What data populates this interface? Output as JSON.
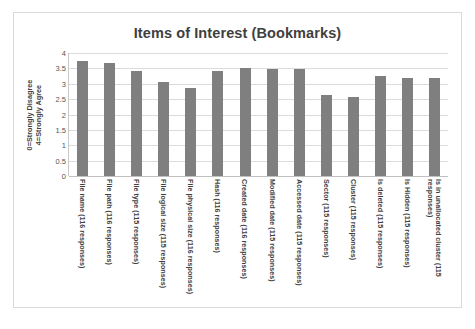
{
  "chart_data": {
    "type": "bar",
    "title": "Items of Interest (Bookmarks)",
    "xlabel": "",
    "ylabel": "0=Strongly Disagree 4=Strongly Agree",
    "ylabel_lines": [
      "0=Strongly Disagree",
      "4=Strongly Agree"
    ],
    "ylim": [
      0,
      4
    ],
    "ytick_labels": [
      "4",
      "3.5",
      "3",
      "2.5",
      "2",
      "1.5",
      "1",
      "0.5",
      "0"
    ],
    "ytick_values": [
      4,
      3.5,
      3,
      2.5,
      2,
      1.5,
      1,
      0.5,
      0
    ],
    "grid": true,
    "legend": "none",
    "bar_color": "#7f7f7f",
    "categories": [
      "File name (116 responses)",
      "File path (116 responses)",
      "File type (115 responses)",
      "File logical size (115 responses)",
      "File physical size (116 responses)",
      "Hash (116 responses)",
      "Created date (116 responses)",
      "Modified date (115 responses)",
      "Accessed date (115 responses)",
      "Sector (115 responses)",
      "Cluster (115 responses)",
      "Is deleted (115 responses)",
      "Is Hidden (115 responses)",
      "Is in unallocated cluster (115 responses)"
    ],
    "values": [
      3.75,
      3.68,
      3.43,
      3.05,
      2.87,
      3.43,
      3.5,
      3.48,
      3.47,
      2.65,
      2.57,
      3.25,
      3.2,
      3.18
    ]
  }
}
